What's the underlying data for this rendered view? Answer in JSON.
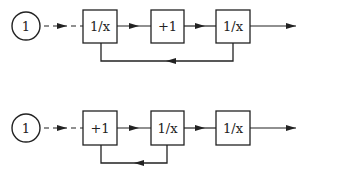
{
  "diagram": {
    "type": "block-diagram",
    "colors": {
      "stroke": "#222222",
      "background": "#ffffff"
    },
    "rows": [
      {
        "id": "row-1",
        "input": {
          "label": "1"
        },
        "blocks": [
          {
            "label": "1/x"
          },
          {
            "label": "+1"
          },
          {
            "label": "1/x"
          }
        ],
        "feedback": {
          "from_block": 3,
          "to_block": 1,
          "direction": "left"
        }
      },
      {
        "id": "row-2",
        "input": {
          "label": "1"
        },
        "blocks": [
          {
            "label": "+1"
          },
          {
            "label": "1/x"
          },
          {
            "label": "1/x"
          }
        ],
        "feedback": {
          "from_block": 2,
          "to_block": 1,
          "direction": "left"
        }
      }
    ]
  }
}
